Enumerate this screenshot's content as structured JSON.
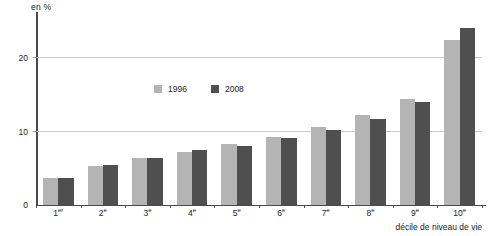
{
  "chart_data": {
    "type": "bar",
    "title": "",
    "subtitle": "",
    "xlabel": "décile de niveau de vie",
    "ylabel": "en %",
    "yunit": "en %",
    "categories": [
      "1er",
      "2e",
      "3e",
      "4e",
      "5e",
      "6e",
      "7e",
      "8e",
      "9e",
      "10e"
    ],
    "category_bases": [
      "1",
      "2",
      "3",
      "4",
      "5",
      "6",
      "7",
      "8",
      "9",
      "10"
    ],
    "category_suffixes": [
      "er",
      "e",
      "e",
      "e",
      "e",
      "e",
      "e",
      "e",
      "e",
      "e"
    ],
    "series": [
      {
        "name": "1996",
        "color": "#b4b4b4",
        "values": [
          3.7,
          5.3,
          6.3,
          7.2,
          8.2,
          9.2,
          10.6,
          12.2,
          14.4,
          22.3
        ]
      },
      {
        "name": "2008",
        "color": "#4f4f4f",
        "values": [
          3.7,
          5.4,
          6.3,
          7.4,
          8.0,
          9.1,
          10.2,
          11.6,
          13.9,
          24.0
        ]
      }
    ],
    "ylim": [
      0,
      26.1
    ],
    "yticks": [
      0,
      10,
      20
    ],
    "ytick_labels": [
      "0",
      "10",
      "20"
    ],
    "grid": true,
    "gridlines_at": [
      10,
      20
    ],
    "legend_position": "inside-top-center",
    "legend_entries": [
      "1996",
      "2008"
    ],
    "axis_color": "#4a4a4a",
    "grid_color": "#c8c8c8",
    "background": "#ffffff"
  }
}
